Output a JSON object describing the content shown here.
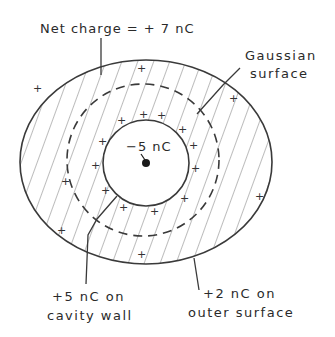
{
  "diagram": {
    "type": "conductor-with-cavity-gauss-law",
    "labels": {
      "net_charge": "Net charge = + 7 nC",
      "gaussian_line1": "Gaussian",
      "gaussian_line2": "surface",
      "point_charge": "−5 nC",
      "cavity_line1": "+5 nC on",
      "cavity_line2": "cavity wall",
      "outer_line1": "+2 nC on",
      "outer_line2": "outer surface"
    },
    "plus_symbol": "+",
    "colors": {
      "stroke": "#3a3a3a",
      "hatch": "#6a6a6a",
      "background": "#ffffff"
    }
  }
}
